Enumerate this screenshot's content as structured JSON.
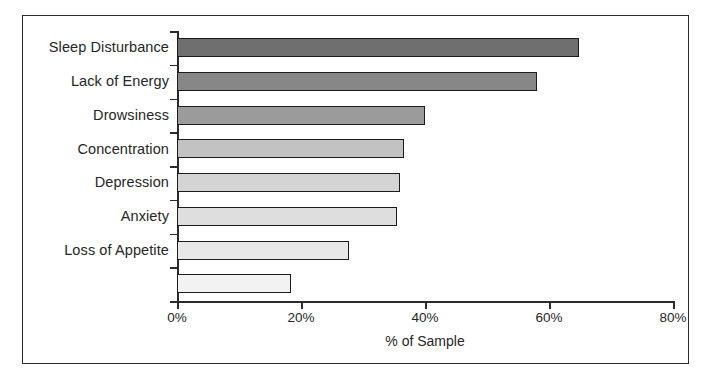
{
  "chart_data": {
    "type": "bar",
    "orientation": "horizontal",
    "title": "",
    "xlabel": "% of Sample",
    "ylabel": "",
    "xlim": [
      0,
      80
    ],
    "grid": false,
    "legend": false,
    "categories": [
      "Sleep Disturbance",
      "Lack of Energy",
      "Drowsiness",
      "Concentration",
      "Depression",
      "Anxiety",
      "Loss of Appetite",
      ""
    ],
    "values": [
      64.8,
      58.0,
      40.0,
      36.6,
      36.0,
      35.5,
      27.7,
      18.4
    ],
    "value_unit": "%",
    "xticks": [
      0,
      20,
      40,
      60,
      80
    ],
    "xtick_labels": [
      "0%",
      "20%",
      "40%",
      "60%",
      "80%"
    ],
    "bar_colors": [
      "#6f6f6f",
      "#878787",
      "#9b9b9b",
      "#c2c2c2",
      "#d4d4d4",
      "#dedede",
      "#e8e8e8",
      "#f2f2f2"
    ],
    "bar_edge_color": "#1c1c1c",
    "axis_color": "#2b2b2b",
    "frame_color": "#2b2b2b",
    "background_color": "#ffffff"
  }
}
